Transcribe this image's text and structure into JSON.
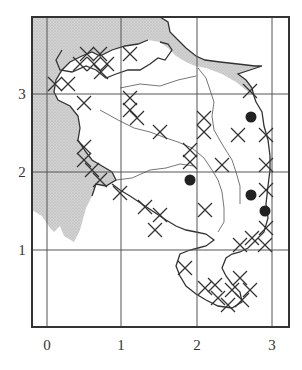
{
  "map": {
    "type": "grid-square distribution map",
    "colors": {
      "frame": "#333333",
      "grid": "#555555",
      "sea_fill": "#c8c8c8",
      "land_fill": "#ffffff",
      "coast": "#333333",
      "boundary": "#666666",
      "marker": "#222222"
    },
    "axes": {
      "x_ticks": [
        {
          "label": "0",
          "px": 47
        },
        {
          "label": "1",
          "px": 121
        },
        {
          "label": "2",
          "px": 197
        },
        {
          "label": "3",
          "px": 272
        }
      ],
      "y_ticks": [
        {
          "label": "3",
          "px": 94
        },
        {
          "label": "2",
          "px": 172
        },
        {
          "label": "1",
          "px": 250
        }
      ]
    },
    "frame": {
      "x": 32,
      "y": 17,
      "w": 257,
      "h": 310
    },
    "legend_markers": {
      "cross": "record (cross symbol)",
      "dot": "record (filled circle)"
    },
    "dots": [
      {
        "x": 251,
        "y": 117
      },
      {
        "x": 190,
        "y": 180
      },
      {
        "x": 251,
        "y": 195
      },
      {
        "x": 265,
        "y": 211
      }
    ],
    "crosses": [
      {
        "x": 87,
        "y": 54
      },
      {
        "x": 100,
        "y": 54
      },
      {
        "x": 130,
        "y": 54
      },
      {
        "x": 80,
        "y": 64
      },
      {
        "x": 94,
        "y": 64
      },
      {
        "x": 107,
        "y": 64
      },
      {
        "x": 101,
        "y": 72
      },
      {
        "x": 55,
        "y": 84
      },
      {
        "x": 68,
        "y": 84
      },
      {
        "x": 130,
        "y": 98
      },
      {
        "x": 130,
        "y": 110
      },
      {
        "x": 137,
        "y": 118
      },
      {
        "x": 84,
        "y": 103
      },
      {
        "x": 160,
        "y": 132
      },
      {
        "x": 250,
        "y": 91
      },
      {
        "x": 204,
        "y": 118
      },
      {
        "x": 204,
        "y": 132
      },
      {
        "x": 238,
        "y": 135
      },
      {
        "x": 266,
        "y": 135
      },
      {
        "x": 190,
        "y": 150
      },
      {
        "x": 190,
        "y": 162
      },
      {
        "x": 222,
        "y": 165
      },
      {
        "x": 266,
        "y": 165
      },
      {
        "x": 84,
        "y": 147
      },
      {
        "x": 84,
        "y": 160
      },
      {
        "x": 92,
        "y": 170
      },
      {
        "x": 100,
        "y": 180
      },
      {
        "x": 120,
        "y": 193
      },
      {
        "x": 145,
        "y": 207
      },
      {
        "x": 160,
        "y": 215
      },
      {
        "x": 155,
        "y": 230
      },
      {
        "x": 205,
        "y": 210
      },
      {
        "x": 266,
        "y": 190
      },
      {
        "x": 266,
        "y": 228
      },
      {
        "x": 252,
        "y": 238
      },
      {
        "x": 240,
        "y": 245
      },
      {
        "x": 265,
        "y": 245
      },
      {
        "x": 185,
        "y": 268
      },
      {
        "x": 205,
        "y": 288
      },
      {
        "x": 218,
        "y": 298
      },
      {
        "x": 232,
        "y": 290
      },
      {
        "x": 228,
        "y": 305
      },
      {
        "x": 242,
        "y": 300
      },
      {
        "x": 250,
        "y": 290
      },
      {
        "x": 240,
        "y": 278
      },
      {
        "x": 215,
        "y": 285
      }
    ]
  }
}
